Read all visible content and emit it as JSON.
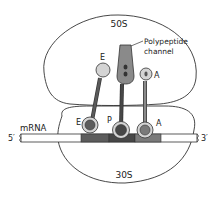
{
  "diagram": {
    "large_subunit": {
      "label": "50S"
    },
    "small_subunit": {
      "label": "30S"
    },
    "channel": {
      "label_line1": "Polypeptide",
      "label_line2": "channel"
    },
    "mrna": {
      "label": "mRNA",
      "five_prime": "5′",
      "three_prime": "3′"
    },
    "sites_50s": {
      "e": "E",
      "a": "A"
    },
    "sites_30s": {
      "e": "E",
      "p": "P",
      "a": "A"
    },
    "colors": {
      "outline": "#333333",
      "light_gray": "#d4d4d4",
      "mid_gray": "#8a8a8a",
      "dark_gray": "#5a5a5a",
      "codon_e": "#5c5c5c",
      "codon_p": "#474747",
      "codon_a": "#7a7a7a"
    }
  }
}
